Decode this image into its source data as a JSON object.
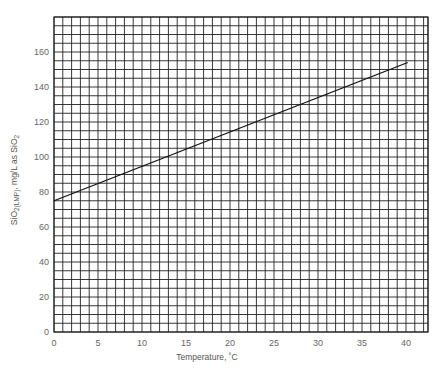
{
  "chart_data": {
    "type": "line",
    "title": "",
    "xlabel": "Temperature, ˚C",
    "ylabel_parts": {
      "main": "SiO",
      "sub": "2(LMP)",
      "mid": ", mg/L as SiO",
      "sub2": "2"
    },
    "ylabel": "SiO2(LMP), mg/L as SiO2",
    "xlim": [
      0,
      42.5
    ],
    "ylim": [
      0,
      180
    ],
    "x_ticks": [
      0,
      5,
      10,
      15,
      20,
      25,
      30,
      35,
      40
    ],
    "y_ticks": [
      0,
      20,
      40,
      60,
      80,
      100,
      120,
      140,
      160
    ],
    "grid": true,
    "grid_x_step": 1,
    "grid_y_step": 5,
    "legend": null,
    "series": [
      {
        "name": "SiO2(LMP)",
        "x": [
          0,
          40.2
        ],
        "values": [
          75,
          154
        ]
      }
    ]
  },
  "colors": {
    "grid": "#222222",
    "line": "#111111",
    "text": "#666666"
  }
}
